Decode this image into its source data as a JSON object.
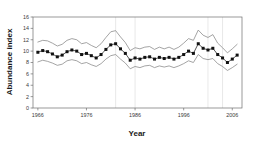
{
  "chart_data": {
    "type": "line",
    "title": "",
    "xlabel": "Year",
    "ylabel": "Abundance index",
    "xlim": [
      1965,
      2008
    ],
    "ylim": [
      0,
      16
    ],
    "xticks": [
      1966,
      1976,
      1986,
      1996,
      2006
    ],
    "yticks": [
      0,
      2,
      4,
      6,
      8,
      10,
      12,
      14,
      16
    ],
    "grid": "vertical",
    "gridline_x": [
      1982,
      1986,
      2001,
      2004
    ],
    "legend": "none",
    "marker": "filled-square",
    "x": [
      1966,
      1967,
      1968,
      1969,
      1970,
      1971,
      1972,
      1973,
      1974,
      1975,
      1976,
      1977,
      1978,
      1979,
      1980,
      1981,
      1982,
      1983,
      1984,
      1985,
      1986,
      1987,
      1988,
      1989,
      1990,
      1991,
      1992,
      1993,
      1994,
      1995,
      1996,
      1997,
      1998,
      1999,
      2000,
      2001,
      2002,
      2003,
      2004,
      2005,
      2006,
      2007
    ],
    "series": [
      {
        "name": "Abundance index",
        "values": [
          9.8,
          10.1,
          9.9,
          9.5,
          9.0,
          9.3,
          9.9,
          10.2,
          10.0,
          9.4,
          9.6,
          9.2,
          8.8,
          9.4,
          10.3,
          11.1,
          11.3,
          10.4,
          9.6,
          8.4,
          8.8,
          8.6,
          8.9,
          9.0,
          8.6,
          8.9,
          8.7,
          8.9,
          8.6,
          8.9,
          9.4,
          10.0,
          9.6,
          11.3,
          10.5,
          10.2,
          10.5,
          9.4,
          8.8,
          8.0,
          8.6,
          9.3
        ]
      },
      {
        "name": "Upper confidence limit",
        "values": [
          11.6,
          11.9,
          11.8,
          11.4,
          10.9,
          11.2,
          11.9,
          12.2,
          12.0,
          11.3,
          11.5,
          11.0,
          10.6,
          11.3,
          12.4,
          13.4,
          13.6,
          12.5,
          11.5,
          10.1,
          10.6,
          10.4,
          10.7,
          10.8,
          10.3,
          10.7,
          10.4,
          10.7,
          10.3,
          10.7,
          11.4,
          12.2,
          11.9,
          13.7,
          12.8,
          12.4,
          12.9,
          11.4,
          10.6,
          9.7,
          10.4,
          11.2
        ]
      },
      {
        "name": "Lower confidence limit",
        "values": [
          8.1,
          8.4,
          8.2,
          7.9,
          7.5,
          7.7,
          8.3,
          8.5,
          8.3,
          7.8,
          8.0,
          7.6,
          7.3,
          7.8,
          8.6,
          9.2,
          9.4,
          8.6,
          7.9,
          6.9,
          7.3,
          7.1,
          7.4,
          7.5,
          7.1,
          7.4,
          7.2,
          7.4,
          7.1,
          7.4,
          7.8,
          8.3,
          8.0,
          9.4,
          8.7,
          8.5,
          8.7,
          7.8,
          7.3,
          6.6,
          7.1,
          7.7
        ]
      }
    ],
    "colors": {
      "index_line": "#2b2b2b",
      "band_line": "#7d7d7d",
      "grid": "#e2e2e2",
      "frame": "#6e6e6e",
      "background": "#ffffff"
    }
  }
}
